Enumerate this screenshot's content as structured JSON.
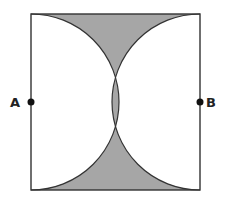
{
  "figure": {
    "shade_color": "#a6a6a6",
    "line_color": "#333333",
    "points": [
      {
        "label": "A",
        "side": "left"
      },
      {
        "label": "B",
        "side": "right"
      }
    ]
  }
}
